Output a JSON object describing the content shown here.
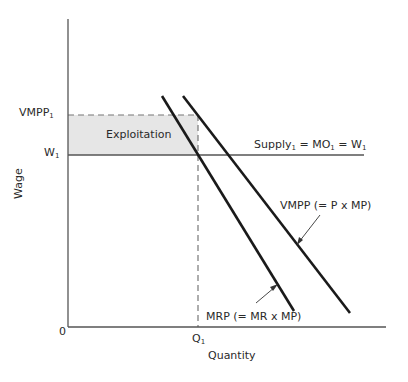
{
  "diagram": {
    "type": "labor-market-monopsony-exploitation",
    "axes": {
      "x_label": "Quantity",
      "y_label": "Wage",
      "origin_label": "0"
    },
    "y_ticks": [
      {
        "label": "VMPP",
        "sub": "1"
      },
      {
        "label": "W",
        "sub": "1"
      }
    ],
    "x_ticks": [
      {
        "label": "Q",
        "sub": "1"
      }
    ],
    "region": {
      "label": "Exploitation",
      "fill": "#e8e8e8"
    },
    "curves": {
      "supply": {
        "label_parts": [
          "Supply",
          "1",
          " = MO",
          "1",
          " = W",
          "1"
        ]
      },
      "vmpp": {
        "label": "VMPP (= P x MP)"
      },
      "mrp": {
        "label": "MRP (= MR x MP)"
      }
    },
    "colors": {
      "line": "#1a1a1a",
      "axis": "#555555",
      "dash": "#777777",
      "shade": "#e8e8e8"
    }
  }
}
